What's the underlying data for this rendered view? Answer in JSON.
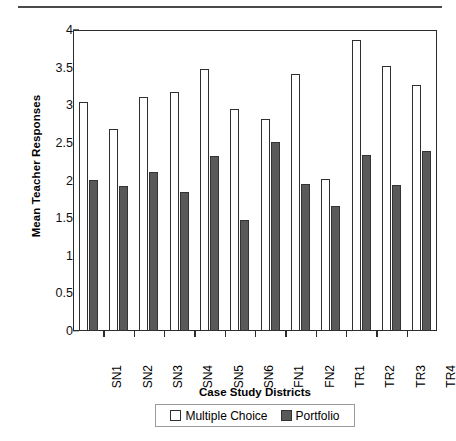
{
  "chart_data": {
    "type": "bar",
    "title": "",
    "xlabel": "Case Study Districts",
    "ylabel": "Mean Teacher Responses",
    "ylim": [
      0,
      4
    ],
    "yticks": [
      "0",
      "0.5",
      "1",
      "1.5",
      "2",
      "2.5",
      "3",
      "3.5",
      "4"
    ],
    "ytick_values": [
      0,
      0.5,
      1,
      1.5,
      2,
      2.5,
      3,
      3.5,
      4
    ],
    "grid": false,
    "legend_position": "bottom",
    "categories": [
      "SN1",
      "SN2",
      "SN3",
      "SN4",
      "SN5",
      "SN6",
      "FN1",
      "FN2",
      "TR1",
      "TR2",
      "TR3",
      "TR4"
    ],
    "series": [
      {
        "name": "Multiple Choice",
        "color": "#ffffff",
        "edge_color": "#2f2f2f",
        "values": [
          3.05,
          2.69,
          3.11,
          3.18,
          3.48,
          2.95,
          2.82,
          3.41,
          2.02,
          3.87,
          3.52,
          3.27
        ]
      },
      {
        "name": "Portfolio",
        "color": "#595959",
        "edge_color": "#333333",
        "values": [
          2.01,
          1.93,
          2.11,
          1.85,
          2.32,
          1.48,
          2.51,
          1.96,
          1.66,
          2.34,
          1.94,
          2.39
        ]
      }
    ]
  },
  "legend": {
    "items": [
      {
        "label": "Multiple Choice",
        "swatch": "open-square-swatch"
      },
      {
        "label": "Portfolio",
        "swatch": "filled-square-swatch"
      }
    ]
  },
  "axes": {
    "x_title": "Case Study Districts",
    "y_title": "Mean Teacher Responses"
  }
}
